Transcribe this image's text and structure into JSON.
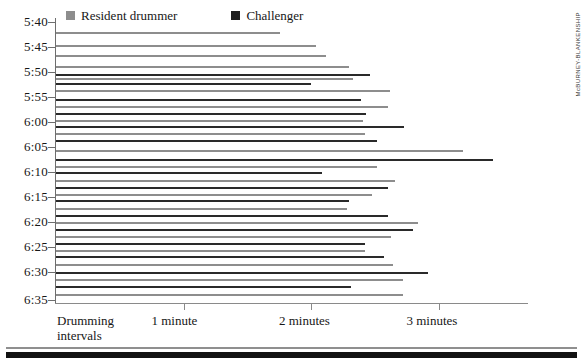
{
  "credit": "McBURNEY-BLANKENSHIP",
  "legend": {
    "position": "top-left",
    "items": [
      {
        "label": "Resident drummer",
        "color": "#8d8d8d",
        "key": "resident"
      },
      {
        "label": "Challenger",
        "color": "#1e1e1e",
        "key": "challenger"
      }
    ]
  },
  "axes": {
    "y_ticks": [
      "5:40",
      "5:45",
      "5:50",
      "5:55",
      "6:00",
      "6:05",
      "6:10",
      "6:15",
      "6:20",
      "6:25",
      "6:30",
      "6:35"
    ],
    "x_ticks": [
      "Drumming intervals",
      "1 minute",
      "2 minutes",
      "3 minutes"
    ],
    "x_tick_values": [
      0,
      1,
      2,
      3
    ],
    "x_origin_label_line1": "Drumming",
    "x_origin_label_line2": "intervals"
  },
  "chart_data": {
    "type": "bar",
    "orientation": "horizontal",
    "title": "",
    "subtitle": "",
    "xlabel": "Drumming intervals",
    "ylabel": "",
    "xlim": [
      0,
      3.7
    ],
    "ylim": [
      "5:40",
      "6:35"
    ],
    "grid": false,
    "legend_position": "top-left",
    "xtick_labels": [
      "Drumming intervals",
      "1 minute",
      "2 minutes",
      "3 minutes"
    ],
    "xtick_values": [
      0,
      1,
      2,
      3
    ],
    "ytick_labels": [
      "5:40",
      "5:45",
      "5:50",
      "5:55",
      "6:00",
      "6:05",
      "6:10",
      "6:15",
      "6:20",
      "6:25",
      "6:30",
      "6:35"
    ],
    "series": [
      {
        "name": "Resident drummer",
        "color": "#8d8d8d"
      },
      {
        "name": "Challenger",
        "color": "#2a2a2a"
      }
    ],
    "bars": [
      {
        "time": "5:41",
        "series": "Resident drummer",
        "value": 1.76,
        "y": 32
      },
      {
        "time": "5:45",
        "series": "Resident drummer",
        "value": 2.04,
        "y": 45
      },
      {
        "time": "5:47",
        "series": "Resident drummer",
        "value": 2.12,
        "y": 55
      },
      {
        "time": "5:50",
        "series": "Resident drummer",
        "value": 2.3,
        "y": 66
      },
      {
        "time": "5:52",
        "series": "Challenger",
        "value": 2.46,
        "y": 74
      },
      {
        "time": "5:52",
        "series": "Resident drummer",
        "value": 2.33,
        "y": 78
      },
      {
        "time": "5:53",
        "series": "Challenger",
        "value": 2.0,
        "y": 83
      },
      {
        "time": "5:54",
        "series": "Resident drummer",
        "value": 2.62,
        "y": 90
      },
      {
        "time": "5:55",
        "series": "Challenger",
        "value": 2.39,
        "y": 99
      },
      {
        "time": "5:56",
        "series": "Resident drummer",
        "value": 2.6,
        "y": 106
      },
      {
        "time": "5:58",
        "series": "Challenger",
        "value": 2.43,
        "y": 113
      },
      {
        "time": "5:59",
        "series": "Resident drummer",
        "value": 2.41,
        "y": 120
      },
      {
        "time": "6:00",
        "series": "Challenger",
        "value": 2.73,
        "y": 126
      },
      {
        "time": "6:01",
        "series": "Resident drummer",
        "value": 2.42,
        "y": 133
      },
      {
        "time": "6:02",
        "series": "Challenger",
        "value": 2.52,
        "y": 140
      },
      {
        "time": "6:05",
        "series": "Resident drummer",
        "value": 3.19,
        "y": 150
      },
      {
        "time": "6:06",
        "series": "Challenger",
        "value": 3.43,
        "y": 159
      },
      {
        "time": "6:07",
        "series": "Resident drummer",
        "value": 2.52,
        "y": 166
      },
      {
        "time": "6:09",
        "series": "Challenger",
        "value": 2.09,
        "y": 172
      },
      {
        "time": "6:10",
        "series": "Resident drummer",
        "value": 2.66,
        "y": 180
      },
      {
        "time": "6:11",
        "series": "Challenger",
        "value": 2.6,
        "y": 187
      },
      {
        "time": "6:12",
        "series": "Resident drummer",
        "value": 2.48,
        "y": 194
      },
      {
        "time": "6:13",
        "series": "Challenger",
        "value": 2.3,
        "y": 200
      },
      {
        "time": "6:15",
        "series": "Resident drummer",
        "value": 2.28,
        "y": 208
      },
      {
        "time": "6:16",
        "series": "Challenger",
        "value": 2.6,
        "y": 215
      },
      {
        "time": "6:17",
        "series": "Resident drummer",
        "value": 2.84,
        "y": 222
      },
      {
        "time": "6:18",
        "series": "Challenger",
        "value": 2.8,
        "y": 229
      },
      {
        "time": "6:19",
        "series": "Resident drummer",
        "value": 2.63,
        "y": 236
      },
      {
        "time": "6:21",
        "series": "Challenger",
        "value": 2.42,
        "y": 243
      },
      {
        "time": "6:22",
        "series": "Resident drummer",
        "value": 2.42,
        "y": 250
      },
      {
        "time": "6:23",
        "series": "Challenger",
        "value": 2.57,
        "y": 256
      },
      {
        "time": "6:25",
        "series": "Resident drummer",
        "value": 2.64,
        "y": 264
      },
      {
        "time": "6:27",
        "series": "Challenger",
        "value": 2.92,
        "y": 272
      },
      {
        "time": "6:28",
        "series": "Resident drummer",
        "value": 2.72,
        "y": 279
      },
      {
        "time": "6:29",
        "series": "Challenger",
        "value": 2.31,
        "y": 286
      },
      {
        "time": "6:30",
        "series": "Resident drummer",
        "value": 2.72,
        "y": 294
      }
    ]
  },
  "geometry": {
    "plot_left": 56,
    "x_per_minute": 127.5,
    "y_tick_positions": [
      22,
      47,
      72,
      97,
      122,
      147,
      172,
      197,
      222,
      247,
      272,
      300
    ]
  }
}
